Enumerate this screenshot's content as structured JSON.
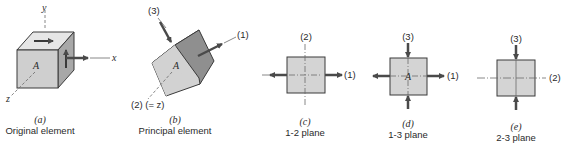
{
  "figure": {
    "colors": {
      "face_light": "#dcdcdc",
      "face_mid": "#c8c8c8",
      "face_dark": "#8a8a8a",
      "edge": "#3a3a3a",
      "arrow": "#4a4a4a",
      "axis": "#6a6a6a"
    },
    "panels": [
      {
        "id": "a",
        "tag": "(a)",
        "caption": "Original element",
        "point_label": "A",
        "axes": {
          "y": "y",
          "x": "x",
          "z": "z"
        }
      },
      {
        "id": "b",
        "tag": "(b)",
        "caption": "Principal element",
        "point_label": "A",
        "axes": {
          "p1": "(1)",
          "p2": "(2) (= z)",
          "p3": "(3)"
        }
      },
      {
        "id": "c",
        "tag": "(c)",
        "caption": "1-2 plane",
        "axes": {
          "horizontal": "(1)",
          "vertical": "(2)"
        }
      },
      {
        "id": "d",
        "tag": "(d)",
        "caption": "1-3 plane",
        "point_label": "A",
        "axes": {
          "horizontal": "(1)",
          "vertical": "(3)"
        }
      },
      {
        "id": "e",
        "tag": "(e)",
        "caption": "2-3 plane",
        "axes": {
          "horizontal": "(2)",
          "vertical": "(3)"
        }
      }
    ]
  }
}
